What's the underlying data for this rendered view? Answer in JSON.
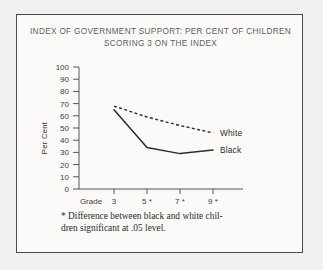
{
  "figure": {
    "title_line1": "INDEX OF GOVERNMENT SUPPORT: PER CENT OF CHILDREN",
    "title_line2": "SCORING 3 ON THE INDEX",
    "footnote_line1": "* Difference between black and white chil-",
    "footnote_line2": "dren significant at .05 level.",
    "border_color": "#4a4a4a",
    "background_color": "#fbfaf8",
    "page_background": "#f2f1ef",
    "ink_color": "#2b2b2b"
  },
  "axes": {
    "x_prefix_label": "Grade",
    "y_axis_label": "Per Cent",
    "y_ticks": [
      "100",
      "90",
      "80",
      "70",
      "60",
      "50",
      "40",
      "30",
      "20",
      "10",
      "0"
    ],
    "x_ticks": [
      "3",
      "5 *",
      "7 *",
      "9 *"
    ]
  },
  "legend": {
    "white_label": "White",
    "black_label": "Black"
  },
  "chart_data": {
    "type": "line",
    "title": "INDEX OF GOVERNMENT SUPPORT: PER CENT OF CHILDREN SCORING 3 ON THE INDEX",
    "xlabel": "Grade",
    "ylabel": "Per Cent",
    "categories": [
      "3",
      "5 *",
      "7 *",
      "9 *"
    ],
    "x": [
      3,
      5,
      7,
      9
    ],
    "ylim": [
      0,
      100
    ],
    "xlim": [
      3,
      9
    ],
    "ytick_step": 10,
    "grid": false,
    "legend_position": "line-end-right",
    "series": [
      {
        "name": "White",
        "style": "dashed",
        "values": [
          68,
          59,
          52,
          46
        ]
      },
      {
        "name": "Black",
        "style": "solid",
        "values": [
          65,
          34,
          29,
          32
        ]
      }
    ],
    "annotations": [
      "* Difference between black and white children significant at .05 level."
    ]
  }
}
